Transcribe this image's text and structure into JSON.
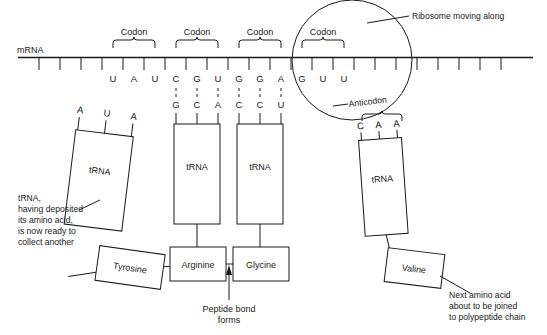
{
  "diagram": {
    "mrna_label": "mRNA",
    "codon_label": "Codon",
    "anticodon_label": "Anticodon",
    "trna_label": "tRNA",
    "ribosome_label": "Ribosome moving along",
    "peptide_note_line1": "Peptide bond",
    "peptide_note_line2": "forms",
    "left_note": {
      "line1": "tRNA,",
      "line2": "having deposited",
      "line3": "its amino acid,",
      "line4": "is now ready to",
      "line5": "collect another"
    },
    "right_note": {
      "line1": "Next amino acid",
      "line2": "about to be joined",
      "line3": "to polypeptide chain"
    },
    "codons": [
      {
        "name": "codon-1",
        "bases": [
          "U",
          "A",
          "U"
        ],
        "bracketed": true
      },
      {
        "name": "codon-2",
        "bases": [
          "C",
          "G",
          "U"
        ],
        "bracketed": true
      },
      {
        "name": "codon-3",
        "bases": [
          "G",
          "G",
          "A"
        ],
        "bracketed": true
      },
      {
        "name": "codon-4",
        "bases": [
          "G",
          "U",
          "U"
        ],
        "bracketed": true
      }
    ],
    "anticodons": [
      {
        "name": "anticodon-1",
        "bases": [
          "A",
          "U",
          "A"
        ],
        "attached": false
      },
      {
        "name": "anticodon-2",
        "bases": [
          "G",
          "C",
          "A"
        ],
        "attached": true
      },
      {
        "name": "anticodon-3",
        "bases": [
          "C",
          "C",
          "U"
        ],
        "attached": true
      },
      {
        "name": "anticodon-4",
        "bases": [
          "C",
          "A",
          "A"
        ],
        "attached": false
      }
    ],
    "amino_acids": [
      {
        "name": "tyrosine",
        "label": "Tyrosine",
        "state": "deposited"
      },
      {
        "name": "arginine",
        "label": "Arginine",
        "state": "in-chain"
      },
      {
        "name": "glycine",
        "label": "Glycine",
        "state": "in-chain"
      },
      {
        "name": "valine",
        "label": "Valine",
        "state": "incoming"
      }
    ],
    "colors": {
      "ink": "#1a1a1a",
      "background": "#ffffff"
    }
  }
}
